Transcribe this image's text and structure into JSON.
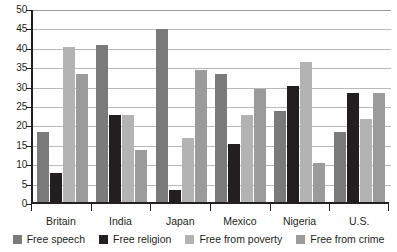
{
  "chart_data": {
    "type": "bar",
    "title": "",
    "xlabel": "",
    "ylabel": "",
    "ylim": [
      0,
      50
    ],
    "ytick_step": 5,
    "yticks": [
      50,
      45,
      40,
      35,
      30,
      25,
      20,
      15,
      10,
      5,
      0
    ],
    "grid": true,
    "legend_position": "bottom",
    "categories": [
      "Britain",
      "India",
      "Japan",
      "Mexico",
      "Nigeria",
      "U.S."
    ],
    "series": [
      {
        "name": "Free speech",
        "color": "#7a7a7a",
        "values": [
          18,
          40.5,
          44.5,
          33,
          23.5,
          18
        ]
      },
      {
        "name": "Free religion",
        "color": "#231f20",
        "values": [
          7.5,
          22.5,
          3,
          15,
          30,
          28
        ]
      },
      {
        "name": "Free from poverty",
        "color": "#b3b3b3",
        "values": [
          40,
          22.5,
          16.5,
          22.5,
          36,
          21.5
        ]
      },
      {
        "name": "Free from crime",
        "color": "#9b9b9b",
        "values": [
          33,
          13.5,
          34,
          29,
          10,
          28
        ]
      }
    ]
  },
  "axis": {
    "y_labels": [
      "50",
      "45",
      "40",
      "35",
      "30",
      "25",
      "20",
      "15",
      "10",
      "5",
      "0"
    ],
    "x_labels": [
      "Britain",
      "India",
      "Japan",
      "Mexico",
      "Nigeria",
      "U.S."
    ]
  },
  "legend": {
    "items": [
      {
        "label": "Free speech",
        "color": "#7a7a7a"
      },
      {
        "label": "Free religion",
        "color": "#231f20"
      },
      {
        "label": "Free from poverty",
        "color": "#b3b3b3"
      },
      {
        "label": "Free from crime",
        "color": "#9b9b9b"
      }
    ]
  }
}
